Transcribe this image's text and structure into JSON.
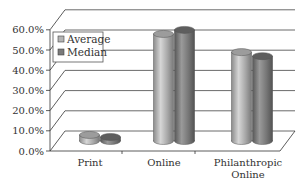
{
  "chart_data": {
    "type": "bar",
    "style": "3d-cylinder",
    "title": "",
    "xlabel": "",
    "ylabel": "",
    "ylim": [
      0,
      60
    ],
    "yticks": [
      "0.0%",
      "10.0%",
      "20.0%",
      "30.0%",
      "40.0%",
      "50.0%",
      "60.0%"
    ],
    "grid": true,
    "legend_position": "top-left",
    "categories": [
      "Print",
      "Online",
      "Philanthropic Online"
    ],
    "category_lines": [
      [
        "Print"
      ],
      [
        "Online"
      ],
      [
        "Philanthropic",
        "Online"
      ]
    ],
    "series": [
      {
        "name": "Average",
        "values": [
          3,
          53,
          44
        ],
        "color": "#b4b4b4"
      },
      {
        "name": "Median",
        "values": [
          2,
          55,
          42
        ],
        "color": "#7a7a7a"
      }
    ]
  }
}
